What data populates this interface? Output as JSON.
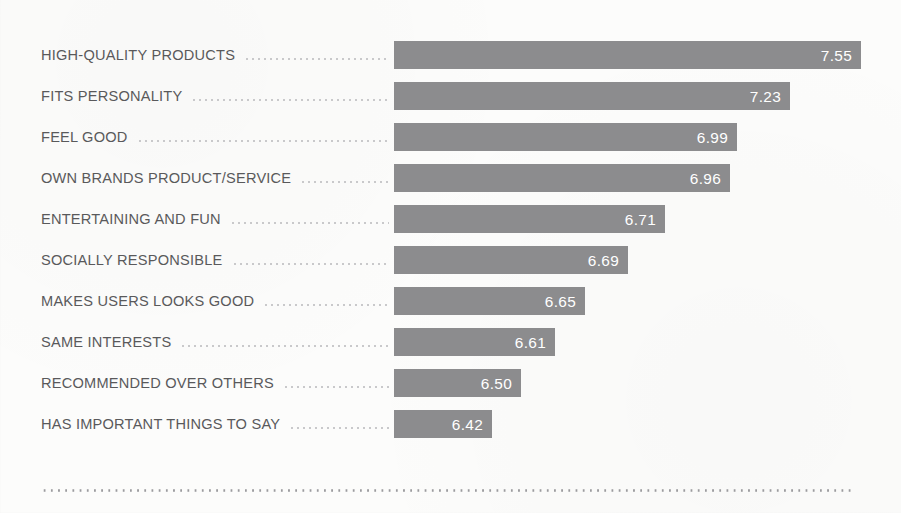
{
  "chart_data": {
    "type": "bar",
    "orientation": "horizontal",
    "title": "",
    "subtitle": "",
    "xlabel": "",
    "ylabel": "",
    "legend": [],
    "grid": false,
    "value_format": "2-decimal",
    "axis_baseline_value": 6.13,
    "xlim": [
      6.13,
      7.55
    ],
    "categories": [
      "HIGH-QUALITY PRODUCTS",
      "FITS PERSONALITY",
      "FEEL GOOD",
      "OWN BRANDS PRODUCT/SERVICE",
      "ENTERTAINING AND FUN",
      "SOCIALLY RESPONSIBLE",
      "MAKES USERS LOOKS GOOD",
      "SAME INTERESTS",
      "RECOMMENDED OVER OTHERS",
      "HAS IMPORTANT THINGS TO SAY"
    ],
    "values": [
      7.55,
      7.23,
      6.99,
      6.96,
      6.71,
      6.69,
      6.65,
      6.61,
      6.5,
      6.42
    ],
    "value_labels": [
      "7.55",
      "7.23",
      "6.99",
      "6.96",
      "6.71",
      "6.69",
      "6.65",
      "6.61",
      "6.50",
      "6.42"
    ],
    "bars": [
      {
        "label": "HIGH-QUALITY PRODUCTS",
        "value": 7.55,
        "value_label": "7.55",
        "bar_end_px": 861
      },
      {
        "label": "FITS PERSONALITY",
        "value": 7.23,
        "value_label": "7.23",
        "bar_end_px": 790
      },
      {
        "label": "FEEL GOOD",
        "value": 6.99,
        "value_label": "6.99",
        "bar_end_px": 737
      },
      {
        "label": "OWN BRANDS PRODUCT/SERVICE",
        "value": 6.96,
        "value_label": "6.96",
        "bar_end_px": 730
      },
      {
        "label": "ENTERTAINING AND FUN",
        "value": 6.71,
        "value_label": "6.71",
        "bar_end_px": 665
      },
      {
        "label": "SOCIALLY RESPONSIBLE",
        "value": 6.69,
        "value_label": "6.69",
        "bar_end_px": 628
      },
      {
        "label": "MAKES USERS LOOKS GOOD",
        "value": 6.65,
        "value_label": "6.65",
        "bar_end_px": 585
      },
      {
        "label": "SAME INTERESTS",
        "value": 6.61,
        "value_label": "6.61",
        "bar_end_px": 555
      },
      {
        "label": "RECOMMENDED OVER OTHERS",
        "value": 6.5,
        "value_label": "6.50",
        "bar_end_px": 521
      },
      {
        "label": "HAS IMPORTANT THINGS TO SAY",
        "value": 6.42,
        "value_label": "6.42",
        "bar_end_px": 492
      }
    ]
  },
  "style": {
    "bar_color": "#8c8c8e",
    "value_text_color": "#ffffff",
    "label_text_color": "#59595b",
    "leader_dot_color": "#c9c9cb",
    "baseline_dot_color": "#9b9b9e",
    "background_color": "#fcfcfb"
  },
  "geometry": {
    "bar_start_px": 394,
    "bar_height_px": 28,
    "row_pitch_px": 41,
    "first_row_top_px": 41,
    "label_left_px": 41,
    "baseline_top_px": 489,
    "baseline_left_px": 41,
    "baseline_width_px": 811
  }
}
